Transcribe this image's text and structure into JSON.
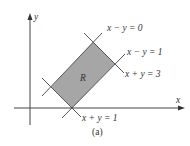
{
  "figure": {
    "caption": "(a)",
    "region_label": "R",
    "axes": {
      "x_label": "x",
      "y_label": "y"
    },
    "lines": [
      {
        "id": "x-minus-y-0",
        "label": "x − y = 0"
      },
      {
        "id": "x-minus-y-1",
        "label": "x − y = 1"
      },
      {
        "id": "x-plus-y-3",
        "label": "x + y = 3"
      },
      {
        "id": "x-plus-y-1",
        "label": "x + y = 1"
      }
    ],
    "colors": {
      "region_fill": "#a6a6a6",
      "line": "#555555",
      "axis": "#444444",
      "text": "#333333"
    }
  }
}
